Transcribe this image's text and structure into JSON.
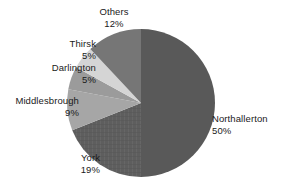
{
  "chart_data": {
    "type": "pie",
    "title": "",
    "subtitle": "",
    "xlabel": "",
    "ylabel": "",
    "legend_position": "none",
    "grid": false,
    "labels_show_percent": true,
    "start_angle_deg": 0,
    "direction": "clockwise",
    "categories": [
      "Northallerton",
      "York",
      "Middlesbrough",
      "Darlington",
      "Thirsk",
      "Others"
    ],
    "values": [
      50,
      19,
      9,
      5,
      5,
      12
    ],
    "units": "%",
    "total": 100,
    "slices": [
      {
        "name": "Northallerton",
        "value": 50,
        "value_label": "50%",
        "color": "#595959",
        "pattern": "solid",
        "start_deg": 0,
        "end_deg": 180,
        "label_position": "right"
      },
      {
        "name": "York",
        "value": 19,
        "value_label": "19%",
        "color": "#5e5e5e",
        "pattern": "crosshatch",
        "start_deg": 180,
        "end_deg": 248.4,
        "label_position": "bottom-left"
      },
      {
        "name": "Middlesbrough",
        "value": 9,
        "value_label": "9%",
        "color": "#a6a6a6",
        "pattern": "solid",
        "start_deg": 248.4,
        "end_deg": 280.8,
        "label_position": "left"
      },
      {
        "name": "Darlington",
        "value": 5,
        "value_label": "5%",
        "color": "#9b9b9b",
        "pattern": "solid",
        "start_deg": 280.8,
        "end_deg": 298.8,
        "label_position": "upper-left"
      },
      {
        "name": "Thirsk",
        "value": 5,
        "value_label": "5%",
        "color": "#d5d5d5",
        "pattern": "solid",
        "start_deg": 298.8,
        "end_deg": 316.8,
        "label_position": "upper-left"
      },
      {
        "name": "Others",
        "value": 12,
        "value_label": "12%",
        "color": "#767676",
        "pattern": "solid",
        "start_deg": 316.8,
        "end_deg": 360,
        "label_position": "top"
      }
    ],
    "geometry": {
      "center_x": 141,
      "center_y": 103,
      "radius": 74
    },
    "colors": {
      "background": "#ffffff",
      "text": "#1a1a1a",
      "northallerton": "#595959",
      "york": "#5e5e5e",
      "middlesbrough": "#a6a6a6",
      "darlington": "#9b9b9b",
      "thirsk": "#d5d5d5",
      "others": "#767676"
    }
  },
  "labels": {
    "others": {
      "name": "Others",
      "value": "12%"
    },
    "thirsk": {
      "name": "Thirsk",
      "value": "5%"
    },
    "darlington": {
      "name": "Darlington",
      "value": "5%"
    },
    "middlesbrough": {
      "name": "Middlesbrough",
      "value": "9%"
    },
    "york": {
      "name": "York",
      "value": "19%"
    },
    "northallerton": {
      "name": "Northallerton",
      "value": "50%"
    }
  }
}
